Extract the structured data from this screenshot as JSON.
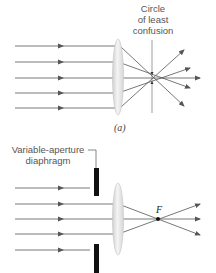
{
  "figure_a": {
    "label_line1": "Circle",
    "label_line2": "of least",
    "label_line3": "confusion",
    "caption": "(a)",
    "incoming_rays": 5,
    "description": "Spherical aberration: parallel rays through a lens focus at different points; circle of least confusion marked"
  },
  "figure_b": {
    "label_line1": "Variable-aperture",
    "label_line2": "diaphragm",
    "focal_point_label": "F",
    "incoming_rays": 5,
    "rays_passing": 3,
    "description": "Diaphragm blocks outer rays so remaining rays converge at focal point F"
  },
  "colors": {
    "ray": "#555555",
    "lens": "#e2e2e2",
    "lens_edge": "#c4c4c4",
    "diaphragm": "#111111",
    "text": "#555555"
  }
}
